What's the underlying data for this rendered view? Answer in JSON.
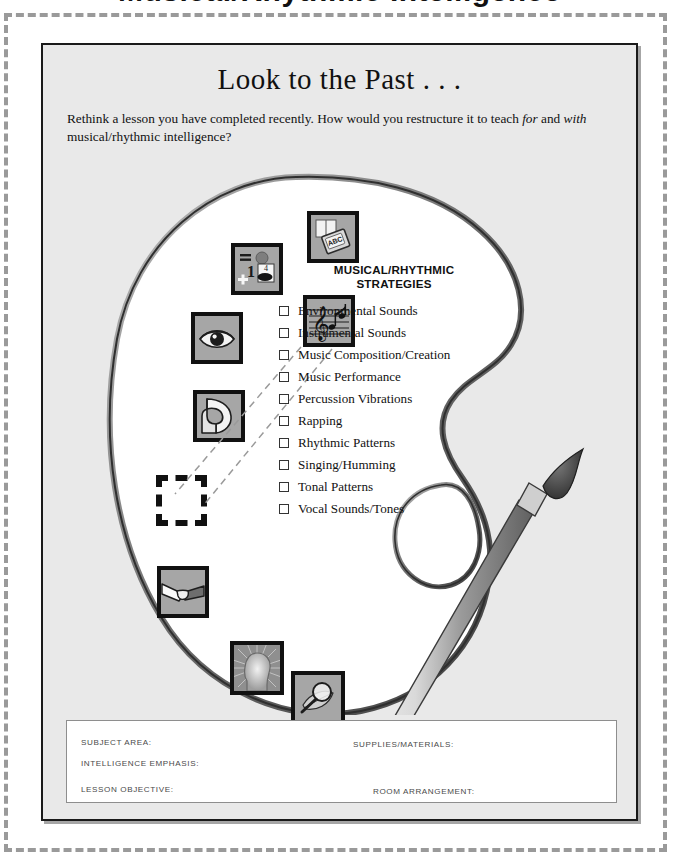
{
  "page": {
    "cropped_top_title": "Musical/Rhythmic Intelligence",
    "worksheet_title": "Look to the Past . . .",
    "prompt_part1": "Rethink a lesson you have completed recently. How would you restructure it to teach ",
    "prompt_em1": "for",
    "prompt_part2": " and ",
    "prompt_em2": "with",
    "prompt_part3": " musical/rhythmic intelligence?",
    "background_color": "#e9e9e9",
    "border_color": "#1a1a1a",
    "page_background": "#ffffff"
  },
  "strategies": {
    "heading_line1": "MUSICAL/RHYTHMIC",
    "heading_line2": "STRATEGIES",
    "items": [
      "Environmental Sounds",
      "Instrumental Sounds",
      "Music Composition/Creation",
      "Music Performance",
      "Percussion Vibrations",
      "Rapping",
      "Rhythmic Patterns",
      "Singing/Humming",
      "Tonal Patterns",
      "Vocal Sounds/Tones"
    ]
  },
  "intelligence_icons": [
    {
      "name": "verbal-linguistic-book-icon",
      "label": "ABC"
    },
    {
      "name": "logical-mathematical-icon",
      "label": "1 4 +"
    },
    {
      "name": "visual-spatial-eye-icon",
      "label": "eye"
    },
    {
      "name": "musical-rhythmic-notes-icon",
      "label": "music staff"
    },
    {
      "name": "bodily-kinesthetic-arm-icon",
      "label": "flexed arm"
    },
    {
      "name": "empty-placeholder-icon",
      "label": ""
    },
    {
      "name": "interpersonal-handshake-icon",
      "label": "handshake"
    },
    {
      "name": "intrapersonal-head-icon",
      "label": "head with rays"
    },
    {
      "name": "naturalist-magnifier-leaf-icon",
      "label": "magnifier and leaf"
    }
  ],
  "form": {
    "subject_area": "SUBJECT AREA:",
    "intelligence_emphasis": "INTELLIGENCE  EMPHASIS:",
    "lesson_objective": "LESSON OBJECTIVE:",
    "supplies_materials": "SUPPLIES/MATERIALS:",
    "room_arrangement": "ROOM ARRANGEMENT:"
  }
}
